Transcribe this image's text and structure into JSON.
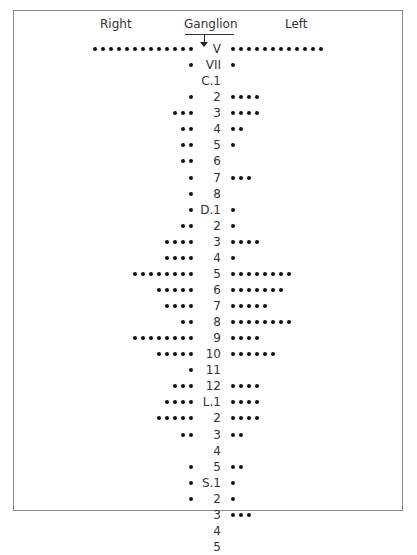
{
  "header": {
    "right_label": "Right",
    "ganglion_label": "Ganglion",
    "left_label": "Left"
  },
  "chart_data": {
    "type": "dot-plot",
    "title": "",
    "columns": [
      "Right",
      "Ganglion",
      "Left"
    ],
    "rows": [
      {
        "label": "V",
        "right": 13,
        "left": 12
      },
      {
        "label": "VII",
        "right": 1,
        "left": 1
      },
      {
        "label": "C.1",
        "right": 0,
        "left": 0
      },
      {
        "label": "2",
        "right": 1,
        "left": 4
      },
      {
        "label": "3",
        "right": 3,
        "left": 4
      },
      {
        "label": "4",
        "right": 2,
        "left": 2
      },
      {
        "label": "5",
        "right": 2,
        "left": 1
      },
      {
        "label": "6",
        "right": 2,
        "left": 0
      },
      {
        "label": "7",
        "right": 1,
        "left": 3
      },
      {
        "label": "8",
        "right": 1,
        "left": 0
      },
      {
        "label": "D.1",
        "right": 1,
        "left": 1
      },
      {
        "label": "2",
        "right": 2,
        "left": 1
      },
      {
        "label": "3",
        "right": 4,
        "left": 4
      },
      {
        "label": "4",
        "right": 4,
        "left": 1
      },
      {
        "label": "5",
        "right": 8,
        "left": 8
      },
      {
        "label": "6",
        "right": 5,
        "left": 7
      },
      {
        "label": "7",
        "right": 4,
        "left": 5
      },
      {
        "label": "8",
        "right": 2,
        "left": 8
      },
      {
        "label": "9",
        "right": 8,
        "left": 4
      },
      {
        "label": "10",
        "right": 5,
        "left": 6
      },
      {
        "label": "11",
        "right": 1,
        "left": 0
      },
      {
        "label": "12",
        "right": 3,
        "left": 4
      },
      {
        "label": "L.1",
        "right": 4,
        "left": 4
      },
      {
        "label": "2",
        "right": 5,
        "left": 4
      },
      {
        "label": "3",
        "right": 2,
        "left": 2
      },
      {
        "label": "4",
        "right": 0,
        "left": 0
      },
      {
        "label": "5",
        "right": 1,
        "left": 2
      },
      {
        "label": "S.1",
        "right": 1,
        "left": 1
      },
      {
        "label": "2",
        "right": 1,
        "left": 1
      },
      {
        "label": "3",
        "right": 0,
        "left": 3
      },
      {
        "label": "4",
        "right": 0,
        "left": 0
      },
      {
        "label": "5",
        "right": 0,
        "left": 0
      }
    ]
  }
}
